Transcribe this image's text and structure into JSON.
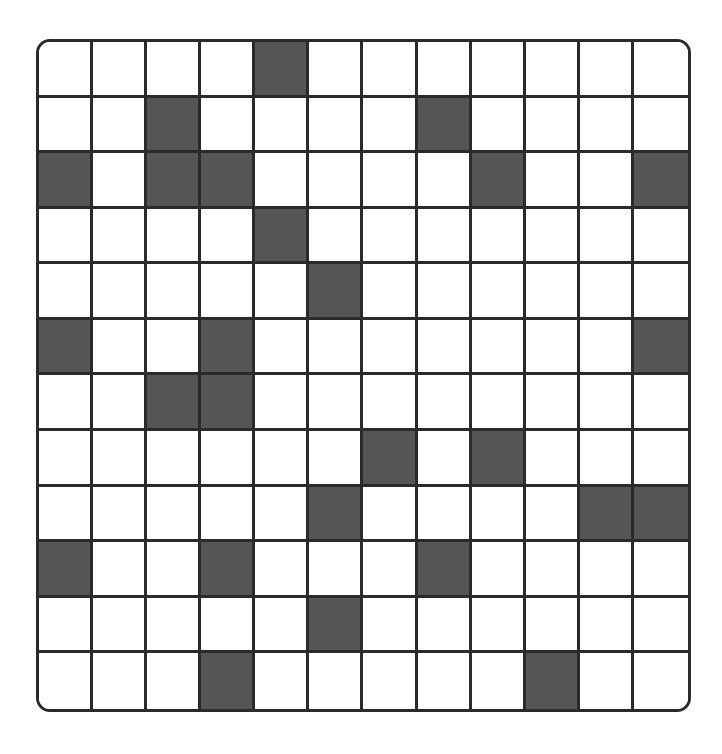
{
  "board": {
    "rows": 12,
    "cols": 12,
    "colors": {
      "filled": "#555555",
      "empty": "#ffffff",
      "line": "#2a2a2a"
    },
    "grid": [
      [
        0,
        0,
        0,
        0,
        1,
        0,
        0,
        0,
        0,
        0,
        0,
        0
      ],
      [
        0,
        0,
        1,
        0,
        0,
        0,
        0,
        1,
        0,
        0,
        0,
        0
      ],
      [
        1,
        0,
        1,
        1,
        0,
        0,
        0,
        0,
        1,
        0,
        0,
        1
      ],
      [
        0,
        0,
        0,
        0,
        1,
        0,
        0,
        0,
        0,
        0,
        0,
        0
      ],
      [
        0,
        0,
        0,
        0,
        0,
        1,
        0,
        0,
        0,
        0,
        0,
        0
      ],
      [
        1,
        0,
        0,
        1,
        0,
        0,
        0,
        0,
        0,
        0,
        0,
        1
      ],
      [
        0,
        0,
        1,
        1,
        0,
        0,
        0,
        0,
        0,
        0,
        0,
        0
      ],
      [
        0,
        0,
        0,
        0,
        0,
        0,
        1,
        0,
        1,
        0,
        0,
        0
      ],
      [
        0,
        0,
        0,
        0,
        0,
        1,
        0,
        0,
        0,
        0,
        1,
        1
      ],
      [
        1,
        0,
        0,
        1,
        0,
        0,
        0,
        1,
        0,
        0,
        0,
        0
      ],
      [
        0,
        0,
        0,
        0,
        0,
        1,
        0,
        0,
        0,
        0,
        0,
        0
      ],
      [
        0,
        0,
        0,
        1,
        0,
        0,
        0,
        0,
        0,
        1,
        0,
        0
      ]
    ]
  }
}
